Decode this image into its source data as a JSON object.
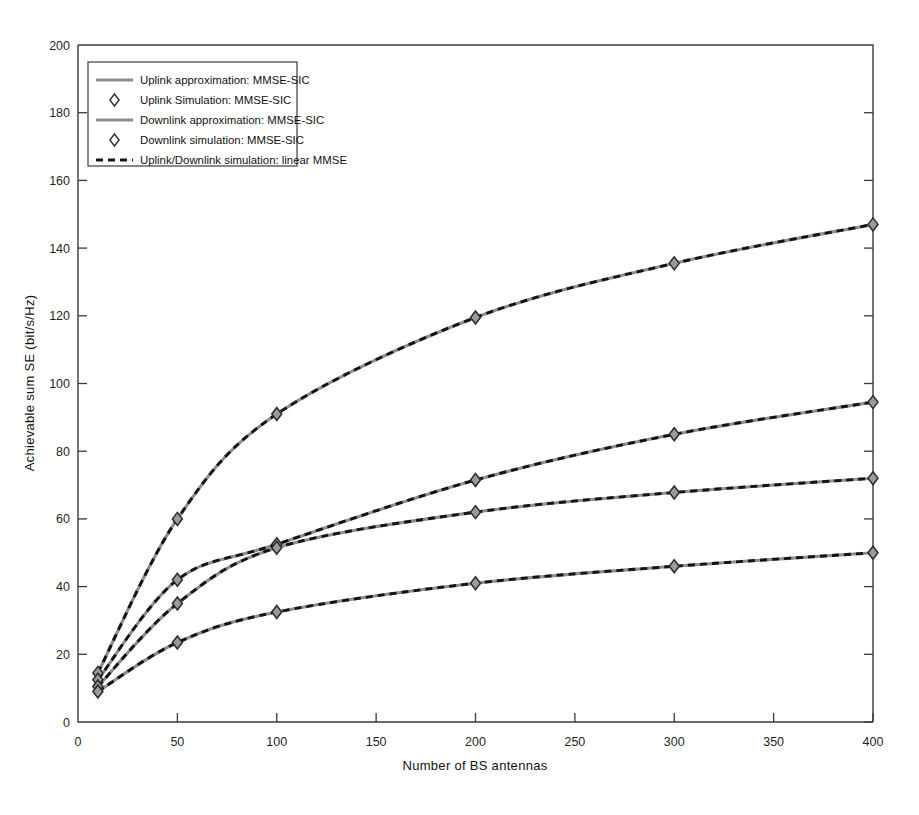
{
  "chart_data": {
    "type": "line",
    "title": "",
    "xlabel": "Number of BS antennas",
    "ylabel": "Achievable sum SE (bit/s/Hz)",
    "xlim": [
      0,
      400
    ],
    "ylim": [
      0,
      200
    ],
    "xticks": [
      0,
      50,
      100,
      150,
      200,
      250,
      300,
      350,
      400
    ],
    "yticks": [
      0,
      20,
      40,
      60,
      80,
      100,
      120,
      140,
      160,
      180,
      200
    ],
    "xticklabels": [
      "0",
      "50",
      "100",
      "150",
      "200",
      "250",
      "300",
      "350",
      "400"
    ],
    "yticklabels": [
      "0",
      "20",
      "40",
      "60",
      "80",
      "100",
      "120",
      "140",
      "160",
      "180",
      "200"
    ],
    "grid": false,
    "legend_position": "upper left",
    "marker_x": [
      10,
      50,
      100,
      200,
      300,
      400
    ],
    "series": [
      {
        "name": "Uplink approximation: MMSE-SIC",
        "style": "solid",
        "color": "#8d8d8d",
        "x": [
          10,
          50,
          100,
          200,
          300,
          400
        ],
        "values": [
          14.5,
          60.0,
          91.0,
          119.5,
          135.5,
          147.0
        ]
      },
      {
        "name": "Uplink Simulation: MMSE-SIC",
        "style": "marker",
        "color": "#9a9a9a",
        "x": [
          10,
          50,
          100,
          200,
          300,
          400
        ],
        "values": [
          14.5,
          60.0,
          91.0,
          119.5,
          135.5,
          147.0
        ]
      },
      {
        "name": "Downlink approximation: MMSE-SIC",
        "style": "solid",
        "color": "#8d8d8d",
        "x": [
          10,
          50,
          100,
          200,
          300,
          400
        ],
        "values": [
          12.5,
          42.0,
          52.5,
          71.5,
          85.0,
          94.5
        ]
      },
      {
        "name": "Downlink simulation: MMSE-SIC",
        "style": "marker",
        "color": "#9a9a9a",
        "x": [
          10,
          50,
          100,
          200,
          300,
          400
        ],
        "values": [
          12.5,
          42.0,
          52.5,
          71.5,
          85.0,
          94.5
        ]
      },
      {
        "name": "Uplink/Downlink simulation: linear MMSE (upper)",
        "style": "dashed",
        "color": "#141414",
        "x": [
          10,
          50,
          100,
          200,
          300,
          400
        ],
        "values": [
          10.5,
          35.0,
          51.5,
          62.0,
          67.8,
          72.0
        ]
      },
      {
        "name": "Uplink/Downlink simulation: linear MMSE (lower)",
        "style": "dashed",
        "color": "#141414",
        "x": [
          10,
          50,
          100,
          200,
          300,
          400
        ],
        "values": [
          9.0,
          23.5,
          32.5,
          41.0,
          46.0,
          50.0
        ]
      }
    ],
    "curves_rendered": [
      {
        "id": "curve-uplink-mmse-sic",
        "values": [
          14.5,
          60.0,
          91.0,
          119.5,
          135.5,
          147.0
        ]
      },
      {
        "id": "curve-downlink-mmse-sic",
        "values": [
          12.5,
          42.0,
          52.5,
          71.5,
          85.0,
          94.5
        ]
      },
      {
        "id": "curve-linear-mmse-upper",
        "values": [
          10.5,
          35.0,
          51.5,
          62.0,
          67.8,
          72.0
        ]
      },
      {
        "id": "curve-linear-mmse-lower",
        "values": [
          9.0,
          23.5,
          32.5,
          41.0,
          46.0,
          50.0
        ]
      }
    ]
  },
  "legend": {
    "items": [
      {
        "label": "Uplink approximation: MMSE-SIC",
        "kind": "solid-line"
      },
      {
        "label": "Uplink Simulation: MMSE-SIC",
        "kind": "marker"
      },
      {
        "label": "Downlink approximation: MMSE-SIC",
        "kind": "solid-line"
      },
      {
        "label": "Downlink simulation: MMSE-SIC",
        "kind": "marker"
      },
      {
        "label": "Uplink/Downlink simulation: linear MMSE",
        "kind": "dashed-line"
      }
    ]
  },
  "colors": {
    "approximation_line": "#8d8d8d",
    "simulation_line": "#141414",
    "marker_fill": "#9a9a9a",
    "axis": "#3a3a3a",
    "background": "#ffffff"
  }
}
